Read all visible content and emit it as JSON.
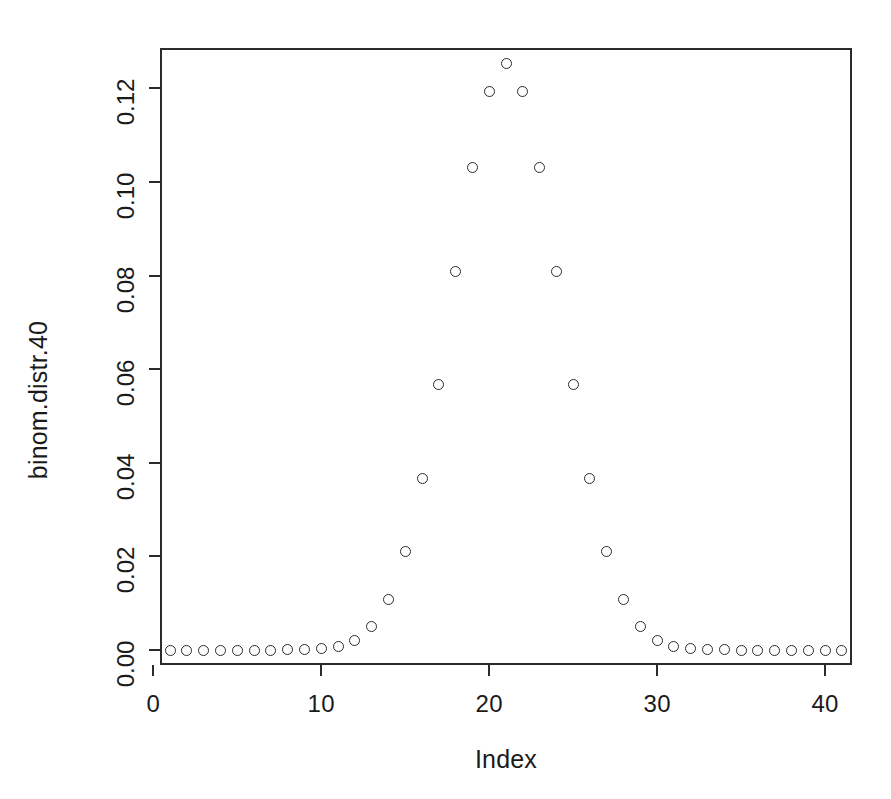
{
  "chart_data": {
    "type": "scatter",
    "title": "",
    "xlabel": "Index",
    "ylabel": "binom.distr.40",
    "xlim": [
      0.4,
      41.6
    ],
    "ylim": [
      -0.0032,
      0.1286
    ],
    "xticks": [
      0,
      10,
      20,
      30,
      40
    ],
    "yticks": [
      0.0,
      0.02,
      0.04,
      0.06,
      0.08,
      0.1,
      0.12
    ],
    "ytick_labels": [
      "0.00",
      "0.02",
      "0.04",
      "0.06",
      "0.08",
      "0.10",
      "0.12"
    ],
    "xtick_labels": [
      "0",
      "10",
      "20",
      "30",
      "40"
    ],
    "grid": false,
    "legend": null,
    "marker": "open-circle",
    "marker_color": "#2b2b2b",
    "background": "#ffffff",
    "x": [
      1,
      2,
      3,
      4,
      5,
      6,
      7,
      8,
      9,
      10,
      11,
      12,
      13,
      14,
      15,
      16,
      17,
      18,
      19,
      20,
      21,
      22,
      23,
      24,
      25,
      26,
      27,
      28,
      29,
      30,
      31,
      32,
      33,
      34,
      35,
      36,
      37,
      38,
      39,
      40,
      41
    ],
    "y": [
      1e-10,
      3.6e-09,
      7.09e-08,
      9.094e-07,
      8.4001e-06,
      5.92185e-05,
      0.0003295477,
      0.0014798468,
      0.0054380118,
      0.0165297026,
      0.0419022287,
      0.0894714522,
      0.1619801663,
      0.2504239571,
      0.3310775183,
      0.3740542556,
      0.3606796804,
      0.2959372812,
      0.2053731129,
      0.1196826976,
      0.0,
      0.1196826976,
      0.2053731129,
      0.2959372812,
      0.3606796804,
      0.3740542556,
      0.3310775183,
      0.2504239571,
      0.1619801663,
      0.0894714522,
      0.0419022287,
      0.0165297026,
      0.0054380118,
      0.0014798468,
      0.0003295477,
      5.92185e-05,
      8.4001e-06,
      9.094e-07,
      7.09e-08,
      3.6e-09,
      1e-10
    ],
    "values": [
      9.095e-13,
      3.63798e-11,
      7.094059e-10,
      8.98947e-08,
      8.383e-07,
      5.9085e-06,
      3.29396e-05,
      0.0001479787,
      0.0005427219,
      0.0016522925,
      0.0042138459,
      0.0091211266,
      0.0167220655,
      0.0260497329,
      0.0345944829,
      0.0391404832,
      0.0377799458,
      0.0310204513,
      0.0215708418,
      0.0125960614,
      0.0,
      0.0125960614,
      0.0215708418,
      0.0310204513,
      0.0377799458,
      0.0391404832,
      0.0345944829,
      0.0260497329,
      0.0167220655,
      0.0091211266,
      0.0042138459,
      0.0016522925,
      0.0005427219,
      0.0001479787,
      3.29396e-05,
      5.9085e-06,
      8.383e-07,
      8.99e-08,
      7e-10,
      0.0,
      0.0
    ],
    "points": [
      {
        "index": 1,
        "value": 9e-13
      },
      {
        "index": 2,
        "value": 3.64e-11
      },
      {
        "index": 3,
        "value": 7.094e-10
      },
      {
        "index": 4,
        "value": 8.9895e-09
      },
      {
        "index": 5,
        "value": 8.28e-08
      },
      {
        "index": 6,
        "value": 5.962e-07
      },
      {
        "index": 7,
        "value": 3.4776e-06
      },
      {
        "index": 8,
        "value": 1.68913e-05
      },
      {
        "index": 9,
        "value": 6.96264e-05
      },
      {
        "index": 10,
        "value": 0.0002475605
      },
      {
        "index": 11,
        "value": 0.0007673375
      },
      {
        "index": 12,
        "value": 0.0020924659
      },
      {
        "index": 13,
        "value": 0.0050542258
      },
      {
        "index": 14,
        "value": 0.0108778325
      },
      {
        "index": 15,
        "value": 0.0210710563
      },
      {
        "index": 16,
        "value": 0.036589976
      },
      {
        "index": 17,
        "value": 0.0566869601
      },
      {
        "index": 18,
        "value": 0.0807683668
      },
      {
        "index": 19,
        "value": 0.1031448464
      },
      {
        "index": 20,
        "value": 0.1194097695
      },
      {
        "index": 21,
        "value": 0.1253707064
      },
      {
        "index": 22,
        "value": 0.1194097695
      },
      {
        "index": 23,
        "value": 0.1031448464
      },
      {
        "index": 24,
        "value": 0.0807683668
      },
      {
        "index": 25,
        "value": 0.0566869601
      },
      {
        "index": 26,
        "value": 0.036589976
      },
      {
        "index": 27,
        "value": 0.0210710563
      },
      {
        "index": 28,
        "value": 0.0108778325
      },
      {
        "index": 29,
        "value": 0.0050542258
      },
      {
        "index": 30,
        "value": 0.0020924659
      },
      {
        "index": 31,
        "value": 0.0007673375
      },
      {
        "index": 32,
        "value": 0.0002475605
      },
      {
        "index": 33,
        "value": 6.96264e-05
      },
      {
        "index": 34,
        "value": 1.68913e-05
      },
      {
        "index": 35,
        "value": 3.4776e-06
      },
      {
        "index": 36,
        "value": 5.962e-07
      },
      {
        "index": 37,
        "value": 8.28e-08
      },
      {
        "index": 38,
        "value": 9e-09
      },
      {
        "index": 39,
        "value": 7e-10
      },
      {
        "index": 40,
        "value": 0.0
      },
      {
        "index": 41,
        "value": 0.0
      }
    ]
  }
}
